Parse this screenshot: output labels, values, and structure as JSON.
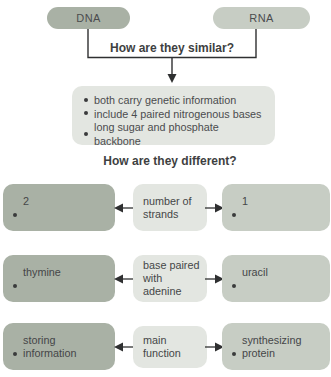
{
  "colors": {
    "dna_fill": "#a9b1a5",
    "rna_fill": "#c7cdc4",
    "neutral_fill": "#e3e6e1",
    "text": "#4b4c4e",
    "line": "#2f3031",
    "background": "#ffffff"
  },
  "header": {
    "dna_label": "DNA",
    "rna_label": "RNA",
    "similar_question": "How are they similar?",
    "different_question": "How are they different?"
  },
  "similarities": [
    "both carry genetic information",
    "include 4 paired nitrogenous bases",
    "long sugar and phosphate backbone"
  ],
  "differences": [
    {
      "dna": "2",
      "category": "number of strands",
      "rna": "1"
    },
    {
      "dna": "thymine",
      "category": "base paired with adenine",
      "rna": "uracil"
    },
    {
      "dna": "storing information",
      "category": "main function",
      "rna": "synthesizing protein"
    }
  ]
}
